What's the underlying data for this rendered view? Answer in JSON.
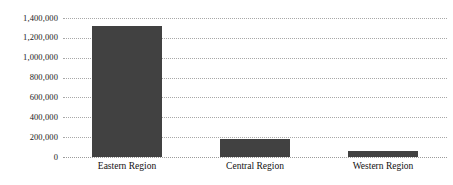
{
  "chart_data": {
    "type": "bar",
    "title": "",
    "xlabel": "",
    "ylabel": "",
    "categories": [
      "Eastern Region",
      "Central Region",
      "Western Region"
    ],
    "values": [
      1320000,
      180000,
      60000
    ],
    "series": [
      {
        "name": "",
        "values": [
          1320000,
          180000,
          60000
        ]
      }
    ],
    "ylim": [
      0,
      1400000
    ],
    "ytick_values": [
      0,
      200000,
      400000,
      600000,
      800000,
      1000000,
      1200000,
      1400000
    ],
    "ytick_labels": [
      "0",
      "200,000",
      "400,000",
      "600,000",
      "800,000",
      "1,000,000",
      "1,200,000",
      "1,400,000"
    ],
    "grid": true,
    "grid_style": "dotted",
    "grid_axis": "y",
    "legend": false,
    "legend_position": "none",
    "bar_color": "#414141",
    "grid_color": "#9a9a9a",
    "background_color": "#ffffff",
    "text_color": "#111111"
  }
}
